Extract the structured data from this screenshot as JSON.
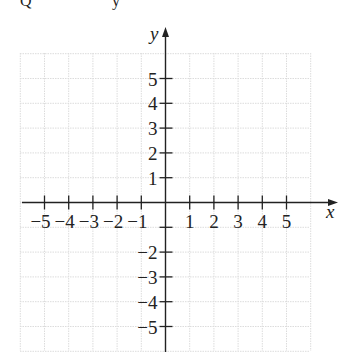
{
  "top_fragment": {
    "left": "Q",
    "right": "y"
  },
  "axes": {
    "x_label": "x",
    "y_label": "y",
    "x_ticks": [
      "-5",
      "-4",
      "-3",
      "-2",
      "-1",
      "1",
      "2",
      "3",
      "4",
      "5"
    ],
    "y_ticks_pos": [
      "5",
      "4",
      "3",
      "2",
      "1"
    ],
    "y_ticks_neg": [
      "-2",
      "-3",
      "-4",
      "-5"
    ]
  },
  "colors": {
    "axis": "#222222",
    "grid": "#d9d9d9",
    "background": "#ffffff"
  },
  "chart_data": {
    "type": "scatter",
    "title": "",
    "xlabel": "x",
    "ylabel": "y",
    "xlim": [
      -6,
      6
    ],
    "ylim": [
      -6,
      6
    ],
    "grid": true,
    "x_tick_labels": [
      "-5",
      "-4",
      "-3",
      "-2",
      "-1",
      "1",
      "2",
      "3",
      "4",
      "5"
    ],
    "y_tick_labels": [
      "5",
      "4",
      "3",
      "2",
      "1",
      "-2",
      "-3",
      "-4",
      "-5"
    ],
    "series": []
  }
}
